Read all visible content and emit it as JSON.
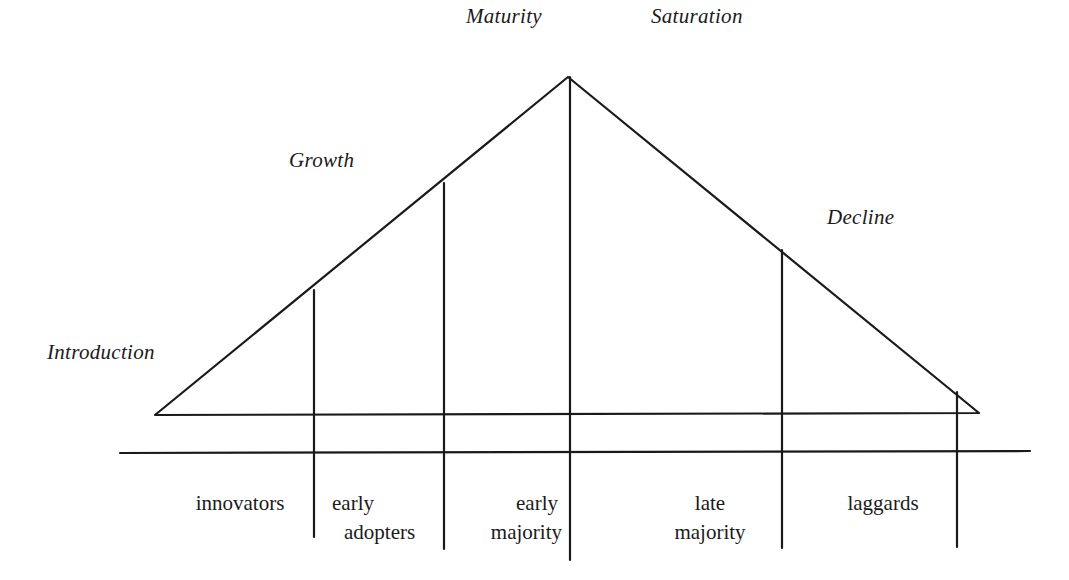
{
  "diagram": {
    "type": "product-life-cycle-vs-adopter-categories",
    "stages": [
      {
        "label": "Introduction"
      },
      {
        "label": "Growth"
      },
      {
        "label": "Maturity"
      },
      {
        "label": "Saturation"
      },
      {
        "label": "Decline"
      }
    ],
    "adopter_categories": [
      {
        "line1": "innovators",
        "line2": ""
      },
      {
        "line1": "early",
        "line2": "adopters"
      },
      {
        "line1": "early",
        "line2": "majority"
      },
      {
        "line1": "late",
        "line2": "majority"
      },
      {
        "line1": "laggards",
        "line2": ""
      }
    ],
    "colors": {
      "line": "#1a1a1a",
      "background": "#ffffff"
    }
  }
}
